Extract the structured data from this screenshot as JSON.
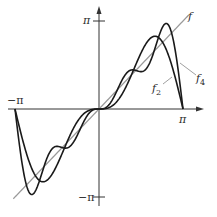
{
  "chart_data": {
    "type": "line",
    "title": "",
    "xlabel": "",
    "ylabel": "",
    "xlim": [
      -3.14159,
      3.14159
    ],
    "ylim": [
      -3.14159,
      3.14159
    ],
    "x_ticks": [
      "−π",
      "π"
    ],
    "y_ticks": [
      "π",
      "−π"
    ],
    "grid": false,
    "series": [
      {
        "name": "f",
        "formula": "x",
        "color": "#9a9a9a",
        "terms": 0
      },
      {
        "name": "f2",
        "formula": "2 sin x − sin 2x",
        "color": "#1a1a1a",
        "terms": 2
      },
      {
        "name": "f4",
        "formula": "2 sin x − sin 2x + (2/3) sin 3x − (1/2) sin 4x",
        "color": "#1a1a1a",
        "terms": 4
      }
    ],
    "annotations": [
      {
        "text": "f",
        "series": "f"
      },
      {
        "text": "f2",
        "series": "f2"
      },
      {
        "text": "f4",
        "series": "f4"
      }
    ]
  },
  "labels": {
    "x_neg_pi": "−π",
    "x_pos_pi": "π",
    "y_pos_pi": "π",
    "y_neg_pi": "−π",
    "f": "f",
    "f2_base": "f",
    "f2_sub": "2",
    "f4_base": "f",
    "f4_sub": "4"
  },
  "layout": {
    "origin_px": [
      99,
      109
    ],
    "px_per_pi_x": 84,
    "px_per_pi_y": 88
  }
}
